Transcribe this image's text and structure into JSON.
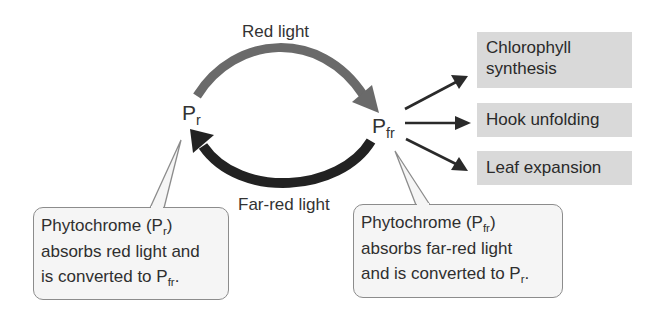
{
  "diagram": {
    "colors": {
      "red_light_arrow": "#6a6a6a",
      "far_red_light_arrow": "#222222",
      "effect_box_fill": "#d9d9d9",
      "callout_fill": "#f5f5f5",
      "callout_border": "#8c8c8c",
      "text": "#2a2a2a"
    },
    "nodes": {
      "pr": {
        "base": "P",
        "sub": "r"
      },
      "pfr": {
        "base": "P",
        "sub": "fr"
      }
    },
    "arrows": {
      "red_light": {
        "label": "Red light",
        "from": "pr",
        "to": "pfr"
      },
      "far_red_light": {
        "label": "Far-red light",
        "from": "pfr",
        "to": "pr"
      }
    },
    "effects": [
      {
        "line1": "Chlorophyll",
        "line2": "synthesis"
      },
      {
        "line1": "Hook unfolding"
      },
      {
        "line1": "Leaf expansion"
      }
    ],
    "callouts": {
      "left": {
        "l1_pre": "Phytochrome (P",
        "l1_sub": "r",
        "l1_post": ")",
        "l2": "absorbs red light and",
        "l3_pre": "is converted to P",
        "l3_sub": "fr",
        "l3_post": "."
      },
      "right": {
        "l1_pre": "Phytochrome (P",
        "l1_sub": "fr",
        "l1_post": ")",
        "l2": "absorbs far-red light",
        "l3_pre": "and is converted to P",
        "l3_sub": "r",
        "l3_post": "."
      }
    }
  }
}
